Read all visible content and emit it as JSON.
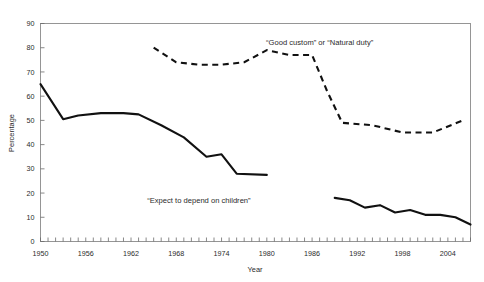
{
  "page": {
    "cut_off_header_text": "",
    "background": "#ffffff",
    "line_color": "#111111"
  },
  "chart_data": {
    "type": "line",
    "title": "",
    "xlabel": "Year",
    "ylabel": "Percentage",
    "xlim": [
      1950,
      2007
    ],
    "ylim": [
      0,
      90
    ],
    "ytick_values": [
      0,
      10,
      20,
      30,
      40,
      50,
      60,
      70,
      80,
      90
    ],
    "ytick_labels": [
      "0",
      "10",
      "20",
      "30",
      "40",
      "50",
      "60",
      "70",
      "80",
      "90"
    ],
    "xtick_labels": [
      "1950",
      "1956",
      "1962",
      "1968",
      "1974",
      "1980",
      "1986",
      "1992",
      "1998",
      "2004"
    ],
    "xtick_values": [
      1950,
      1956,
      1962,
      1968,
      1974,
      1980,
      1986,
      1992,
      1998,
      2004
    ],
    "x_minor_tick_step": 1,
    "grid": false,
    "legend": "annotations",
    "annotations": [
      {
        "name": "good-custom-label",
        "text": "“Good custom” or “Natural duty”",
        "x": 1987,
        "y": 81
      },
      {
        "name": "expect-depend-label",
        "text": "“Expect to depend on children”",
        "x": 1971,
        "y": 16
      }
    ],
    "series": [
      {
        "name": "“Expect to depend on children”",
        "style": "solid",
        "segments": [
          {
            "x": [
              1950,
              1953,
              1955,
              1958,
              1961,
              1963,
              1966,
              1969,
              1972,
              1974,
              1976,
              1980
            ],
            "values": [
              65,
              50.5,
              52,
              53,
              53,
              52.5,
              48,
              43,
              35,
              36,
              28,
              27.5,
              25
            ]
          },
          {
            "x": [
              1989,
              1991,
              1993,
              1995,
              1997,
              1999,
              2001,
              2003,
              2005,
              2007
            ],
            "values": [
              18,
              17,
              14,
              15,
              12,
              13,
              11,
              11,
              10,
              7
            ]
          }
        ]
      },
      {
        "name": "“Good custom” or “Natural duty”",
        "style": "dashed",
        "segments": [
          {
            "x": [
              1965,
              1968,
              1971,
              1974,
              1977,
              1980,
              1983,
              1986,
              1988,
              1990,
              1994,
              1998,
              2002,
              2006
            ],
            "values": [
              80,
              74,
              73,
              73,
              74,
              79,
              77,
              77,
              62,
              49,
              48,
              45,
              45,
              50
            ]
          }
        ]
      }
    ]
  }
}
